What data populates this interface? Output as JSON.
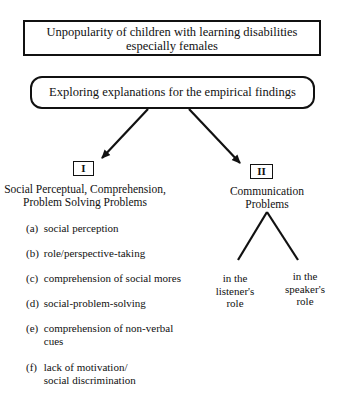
{
  "top_box": {
    "line1": "Unpopularity of children with learning disabilities",
    "line2": "especially females"
  },
  "explore_box": {
    "label": "Exploring explanations for the empirical findings"
  },
  "branch_1": {
    "numeral": "I",
    "heading_line1": "Social Perceptual, Comprehension,",
    "heading_line2": "Problem Solving Problems",
    "items": [
      {
        "letter": "(a)",
        "line1": "social perception",
        "line2": ""
      },
      {
        "letter": "(b)",
        "line1": "role/perspective-taking",
        "line2": ""
      },
      {
        "letter": "(c)",
        "line1": "comprehension of social mores",
        "line2": ""
      },
      {
        "letter": "(d)",
        "line1": "social-problem-solving",
        "line2": ""
      },
      {
        "letter": "(e)",
        "line1": "comprehension of non-verbal",
        "line2": "cues"
      },
      {
        "letter": "(f)",
        "line1": "lack of motivation/",
        "line2": "social discrimination"
      }
    ]
  },
  "branch_2": {
    "numeral": "II",
    "heading_line1": "Communication",
    "heading_line2": "Problems",
    "leaves": [
      {
        "line1": "in the",
        "line2": "listener's",
        "line3": "role"
      },
      {
        "line1": "in the",
        "line2": "speaker's",
        "line3": "role"
      }
    ]
  }
}
